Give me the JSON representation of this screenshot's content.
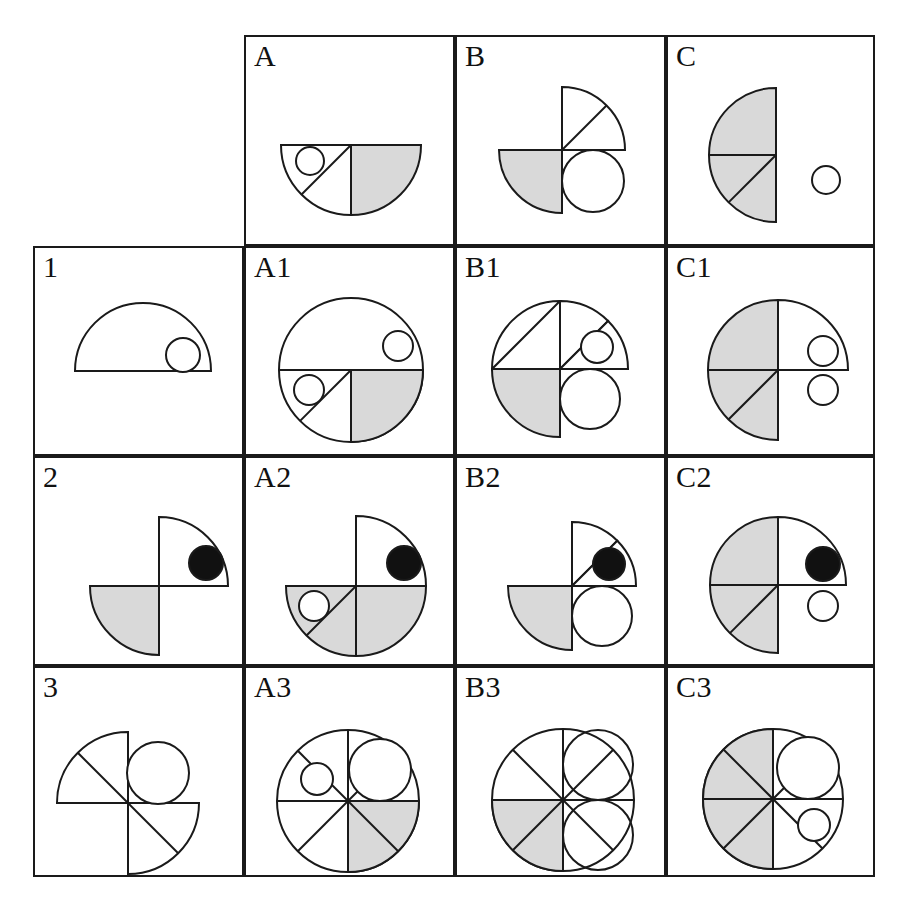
{
  "figure": {
    "type": "matrix-grid",
    "rows": 4,
    "cols": 4,
    "colors": {
      "stroke": "#1a1a1a",
      "shaded_fill": "#d9d9d9",
      "solid_fill": "#111111",
      "background": "#ffffff"
    }
  },
  "labels": {
    "corner": "",
    "columns": [
      "A",
      "B",
      "C"
    ],
    "rows": [
      "1",
      "2",
      "3"
    ],
    "cells": [
      [
        "",
        "A",
        "B",
        "C"
      ],
      [
        "1",
        "A1",
        "B1",
        "C1"
      ],
      [
        "2",
        "A2",
        "B2",
        "C2"
      ],
      [
        "3",
        "A3",
        "B3",
        "C3"
      ]
    ]
  },
  "cells": {
    "corner": {
      "label": "",
      "shape": "none"
    },
    "col_A": {
      "label": "A",
      "shape": "lower-semicircle-split-with-small-circle"
    },
    "col_B": {
      "label": "B",
      "shape": "quarter-upper-right-with-diagonal-and-lower-left-shaded-quarter-plus-circle"
    },
    "col_C": {
      "label": "C",
      "shape": "left-semicircle-shaded-with-separate-small-circle"
    },
    "row_1": {
      "label": "1",
      "shape": "upper-semicircle-with-small-circle"
    },
    "A1": {
      "label": "A1",
      "shape": "circle-lower-half-split-shaded-right-quadrant"
    },
    "B1": {
      "label": "B1",
      "shape": "circle-with-wedge-and-shaded-lower-left"
    },
    "C1": {
      "label": "C1",
      "shape": "circle-left-half-shaded-two-small-circles"
    },
    "row_2": {
      "label": "2",
      "shape": "pinwheel-quarters-with-solid-dot"
    },
    "A2": {
      "label": "A2",
      "shape": "circle-lower-half-shaded-solid-dot"
    },
    "B2": {
      "label": "B2",
      "shape": "wedge-with-solid-dot-shaded-lower-left-plus-circle"
    },
    "C2": {
      "label": "C2",
      "shape": "circle-left-half-shaded-solid-dot-and-circle"
    },
    "row_3": {
      "label": "3",
      "shape": "pinwheel-with-circle"
    },
    "A3": {
      "label": "A3",
      "shape": "octant-circle-shaded-lower-right-two-circles"
    },
    "B3": {
      "label": "B3",
      "shape": "octant-circle-shaded-lower-left-two-circles"
    },
    "C3": {
      "label": "C3",
      "shape": "octant-circle-left-half-shaded-two-circles"
    }
  }
}
